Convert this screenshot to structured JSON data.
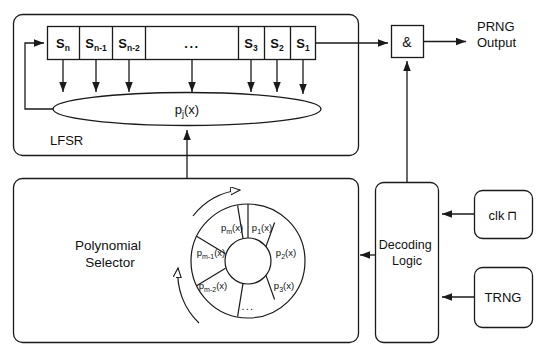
{
  "diagram": {
    "stroke_color": "#1a1a1a",
    "fill_color": "#ffffff"
  },
  "lfsr": {
    "container_label": "LFSR",
    "feedback_polynomial": "p",
    "feedback_polynomial_sub": "j",
    "feedback_polynomial_tail": "(x)",
    "cells": [
      {
        "base": "S",
        "sub": "n"
      },
      {
        "base": "S",
        "sub": "n-1"
      },
      {
        "base": "S",
        "sub": "n-2"
      },
      {
        "base": "...",
        "sub": ""
      },
      {
        "base": "S",
        "sub": "3"
      },
      {
        "base": "S",
        "sub": "2"
      },
      {
        "base": "S",
        "sub": "1"
      }
    ]
  },
  "and_gate": {
    "label": "&"
  },
  "output": {
    "line1": "PRNG",
    "line2": "Output"
  },
  "polynomial_selector": {
    "label_line1": "Polynomial",
    "label_line2": "Selector",
    "wheel_sectors": [
      {
        "base": "p",
        "sub": "1",
        "tail": "(x)"
      },
      {
        "base": "p",
        "sub": "2",
        "tail": "(x)"
      },
      {
        "base": "p",
        "sub": "3",
        "tail": "(x)"
      },
      {
        "base": "...",
        "sub": "",
        "tail": ""
      },
      {
        "base": "p",
        "sub": "m-2",
        "tail": "(x)"
      },
      {
        "base": "p",
        "sub": "m-1",
        "tail": "(x)"
      },
      {
        "base": "p",
        "sub": "m",
        "tail": "(x)"
      }
    ]
  },
  "decoding_logic": {
    "label_line1": "Decoding",
    "label_line2": "Logic"
  },
  "clk": {
    "label": "clk",
    "glyph": "⊓"
  },
  "trng": {
    "label": "TRNG"
  }
}
